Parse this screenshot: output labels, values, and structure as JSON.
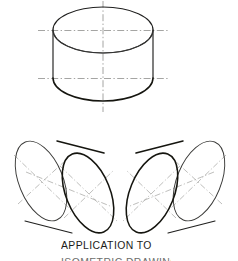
{
  "figure": {
    "title": "APPLICATION TO",
    "caption": "APPLICATION TO",
    "partial_next_line": "ISOMETRIC DRAWING",
    "background_color": "#ffffff",
    "ink_color": "#20201f",
    "centerline_color": "#8e8e8c",
    "drawing_type": "isometric-cylinder-construction",
    "object_count": 3,
    "objects": [
      {
        "name": "vertical-cylinder",
        "label": "top vertical cylinder",
        "axis_orientation": "vertical",
        "center_x": 103,
        "top_ellipse_cy": 30,
        "bottom_ellipse_cy": 78,
        "semi_major": 50,
        "semi_minor": 23,
        "height": 48
      },
      {
        "name": "left-tilted-cylinder",
        "label": "lower left tilted cylinder",
        "axis_orientation": "isometric-right-down",
        "axis_angle_deg": 30,
        "front_ellipse_cx": 88,
        "front_ellipse_cy": 193,
        "back_ellipse_cx": 41,
        "back_ellipse_cy": 181,
        "semi_major": 42,
        "semi_minor": 22
      },
      {
        "name": "right-tilted-cylinder",
        "label": "lower right tilted cylinder",
        "axis_orientation": "isometric-left-down",
        "axis_angle_deg": -30,
        "front_ellipse_cx": 152,
        "front_ellipse_cy": 193,
        "back_ellipse_cx": 199,
        "back_ellipse_cy": 181,
        "semi_major": 42,
        "semi_minor": 22
      }
    ],
    "centerlines": {
      "style": "dash-dot",
      "top_cylinder_horizontal_upper_y": 30,
      "top_cylinder_horizontal_lower_y": 78,
      "top_cylinder_horizontal_x1": 38,
      "top_cylinder_horizontal_x2": 170,
      "top_cylinder_vertical_x": 103,
      "top_cylinder_vertical_y1": 0,
      "top_cylinder_vertical_y2": 112
    }
  }
}
